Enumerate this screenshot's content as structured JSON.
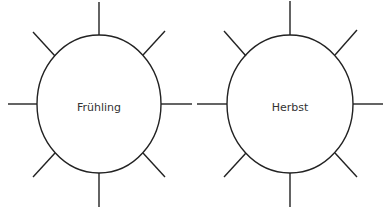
{
  "suns": [
    {
      "label": "Frühling",
      "cx": 99,
      "cy": 104,
      "rx": 62,
      "ry": 69
    },
    {
      "label": "Herbst",
      "cx": 290,
      "cy": 104,
      "rx": 63,
      "ry": 69
    }
  ],
  "colors": {
    "stroke": "#222222",
    "text": "#333333"
  }
}
